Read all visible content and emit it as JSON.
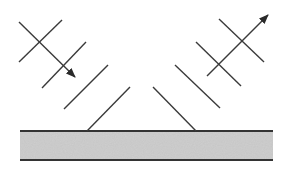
{
  "diagram": {
    "title": "",
    "colors": {
      "line": "#3a3a3a",
      "slab_fill": "#cfcfcf",
      "slab_border": "#333333",
      "background": "#ffffff"
    },
    "surface": {
      "x": 20,
      "y": 131,
      "width": 253,
      "height": 29
    },
    "incident": {
      "ray": {
        "x1": 19,
        "y1": 22,
        "x2": 75,
        "y2": 77
      },
      "wavefronts": [
        {
          "x1": 19,
          "y1": 62,
          "x2": 62,
          "y2": 20
        },
        {
          "x1": 42,
          "y1": 88,
          "x2": 86,
          "y2": 42
        },
        {
          "x1": 64,
          "y1": 109,
          "x2": 108,
          "y2": 65
        },
        {
          "x1": 87,
          "y1": 131,
          "x2": 130,
          "y2": 87
        }
      ]
    },
    "reflected": {
      "ray": {
        "x1": 207,
        "y1": 76,
        "x2": 268,
        "y2": 15
      },
      "wavefronts": [
        {
          "x1": 153,
          "y1": 87,
          "x2": 196,
          "y2": 131
        },
        {
          "x1": 175,
          "y1": 65,
          "x2": 220,
          "y2": 108
        },
        {
          "x1": 196,
          "y1": 42,
          "x2": 241,
          "y2": 86
        },
        {
          "x1": 219,
          "y1": 19,
          "x2": 264,
          "y2": 62
        }
      ]
    }
  }
}
